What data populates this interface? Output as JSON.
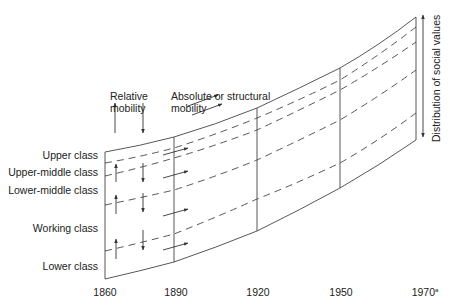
{
  "diagram": {
    "legend": {
      "relative": [
        "Relative",
        "mobility"
      ],
      "absolute": [
        "Absolute or structural",
        "mobility"
      ]
    },
    "classes": [
      "Upper class",
      "Upper-middle class",
      "Lower-middle class",
      "Working class",
      "Lower class"
    ],
    "x_ticks": [
      "1860",
      "1890",
      "1920",
      "1950",
      "1970"
    ],
    "x_tick_last_sup": "a",
    "vertical_axis_label": "Distribution of social values",
    "stroke_color": "#333333"
  }
}
